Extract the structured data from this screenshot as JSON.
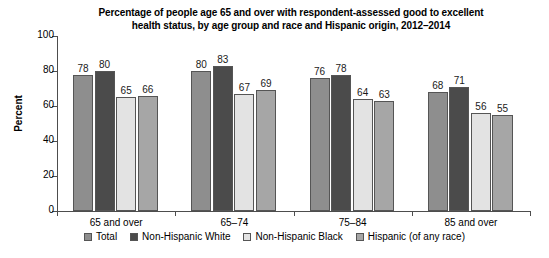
{
  "chart_data": {
    "type": "bar",
    "title": "Percentage of people age 65 and over with respondent-assessed good to excellent health status, by age group and race and Hispanic origin, 2012–2014",
    "title_line1": "Percentage of people age 65 and over with respondent-assessed good to excellent",
    "title_line2": "health status, by age group and race and Hispanic origin, 2012–2014",
    "xlabel": "",
    "ylabel": "Percent",
    "ylim": [
      0,
      100
    ],
    "ytick_labels": [
      "0",
      "20",
      "40",
      "60",
      "80",
      "100"
    ],
    "ytick_values": [
      0,
      20,
      40,
      60,
      80,
      100
    ],
    "grid": false,
    "legend_position": "bottom",
    "categories": [
      "65 and over",
      "65–74",
      "75–84",
      "85 and over"
    ],
    "series": [
      {
        "name": "Total",
        "color": "#8e8e8e",
        "values": [
          78,
          80,
          76,
          68
        ]
      },
      {
        "name": "Non-Hispanic White",
        "color": "#4b4b4b",
        "values": [
          80,
          83,
          78,
          71
        ]
      },
      {
        "name": "Non-Hispanic Black",
        "color": "#e3e3e3",
        "values": [
          65,
          67,
          64,
          56
        ]
      },
      {
        "name": "Hispanic (of any race)",
        "color": "#a6a6a6",
        "values": [
          66,
          69,
          63,
          55
        ]
      }
    ]
  }
}
